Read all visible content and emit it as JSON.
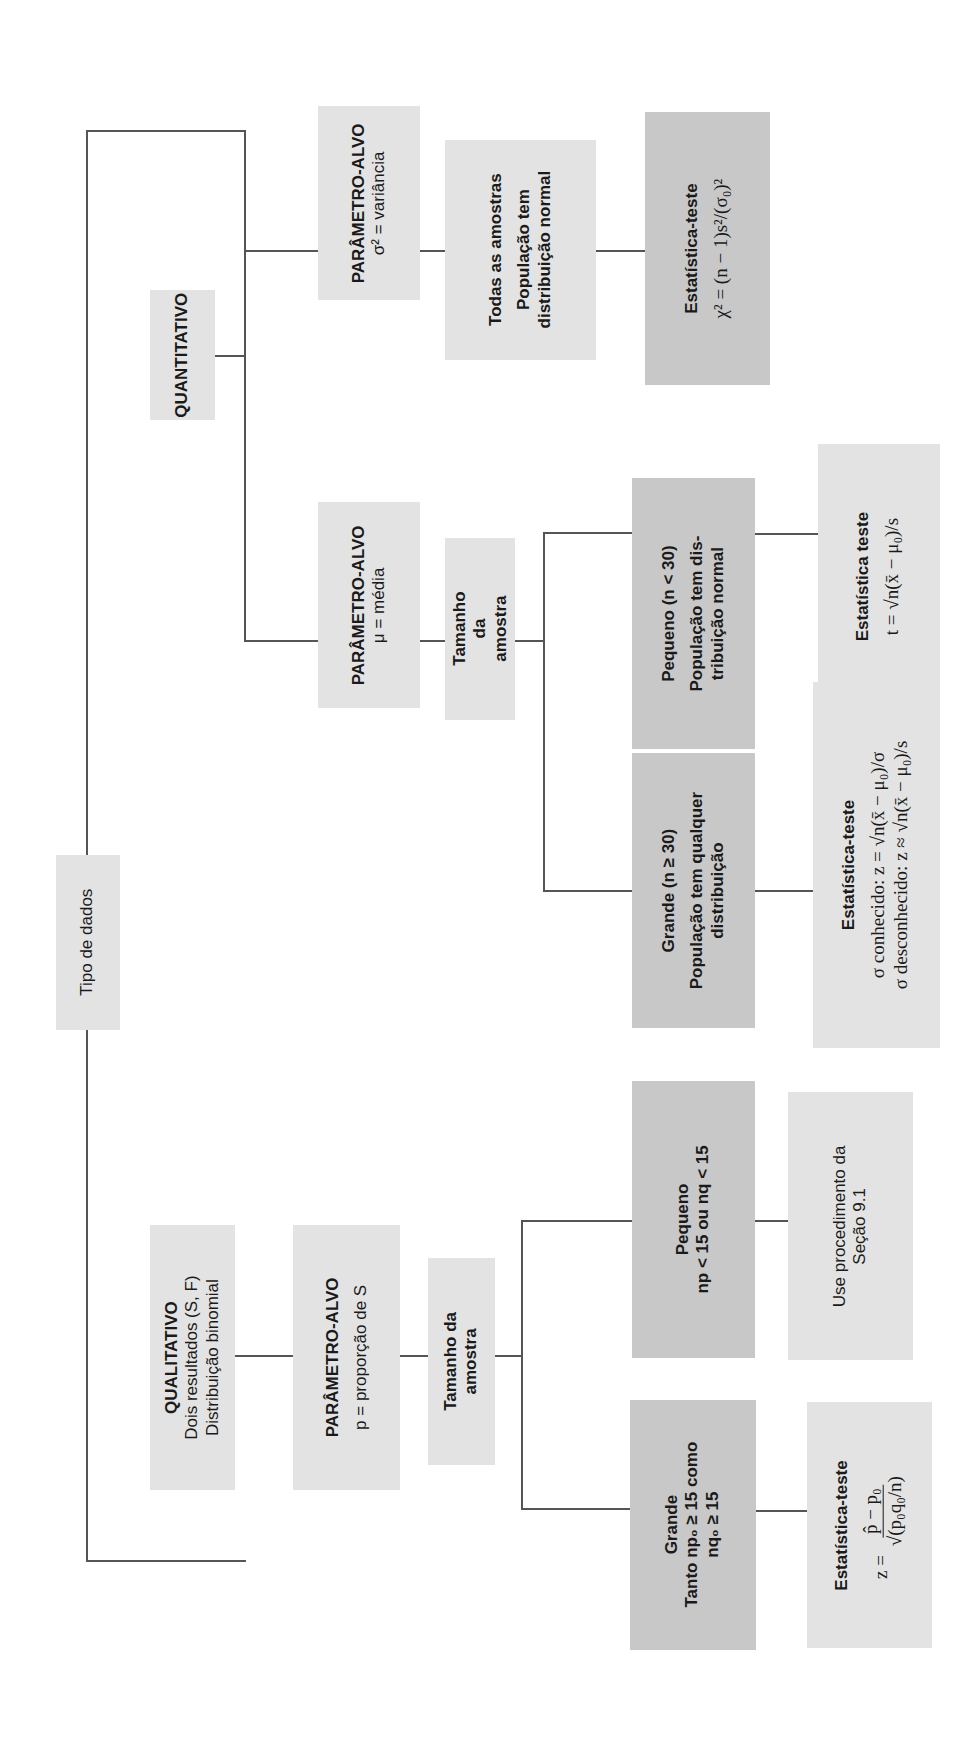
{
  "root": {
    "label": "Tipo de dados"
  },
  "quantitative": {
    "title": "QUANTITATIVO",
    "variance": {
      "param_title": "PARÂMETRO-ALVO",
      "param_desc": "σ² = variância",
      "condition_line1": "Todas as amostras",
      "condition_line2": "População tem",
      "condition_line3": "distribuição normal",
      "test_title": "Estatística-teste",
      "test_formula": "χ² = (n − 1)s²/(σ₀)²"
    },
    "mean": {
      "param_title": "PARÂMETRO-ALVO",
      "param_desc": "μ = média",
      "sample_size": "Tamanho da amostra",
      "small": {
        "title": "Pequeno (n < 30)",
        "desc_line1": "População tem dis-",
        "desc_line2": "tribuição normal",
        "test_title": "Estatística teste",
        "test_formula": "t = √n(x̄ − μ₀)/s"
      },
      "large": {
        "title": "Grande (n ≥ 30)",
        "desc_line1": "População tem qualquer",
        "desc_line2": "distribuição",
        "test_title": "Estatística-teste",
        "test_formula_known": "σ conhecido: z = √n(x̄ − μ₀)/σ",
        "test_formula_unknown": "σ desconhecido: z ≈ √n(x̄ − μ₀)/s"
      }
    }
  },
  "qualitative": {
    "title": "QUALITATIVO",
    "desc_line1": "Dois resultados (S, F)",
    "desc_line2": "Distribuição binomial",
    "param_title": "PARÂMETRO-ALVO",
    "param_desc": "p = proporção de S",
    "sample_size_line1": "Tamanho da",
    "sample_size_line2": "amostra",
    "small": {
      "title": "Pequeno",
      "desc": "np < 15 ou nq < 15",
      "action_line1": "Use procedimento da",
      "action_line2": "Seção 9.1"
    },
    "large": {
      "title": "Grande",
      "desc_line1": "Tanto np₀ ≥ 15 como",
      "desc_line2": "nq₀ ≥ 15",
      "test_title": "Estatística-teste",
      "test_lhs": "z =",
      "test_num": "p̂ − p₀",
      "test_den": "√(p₀q₀/n)"
    }
  },
  "colors": {
    "light_box": "#e3e3e3",
    "dark_box": "#c8c8c8",
    "line": "#555555"
  }
}
